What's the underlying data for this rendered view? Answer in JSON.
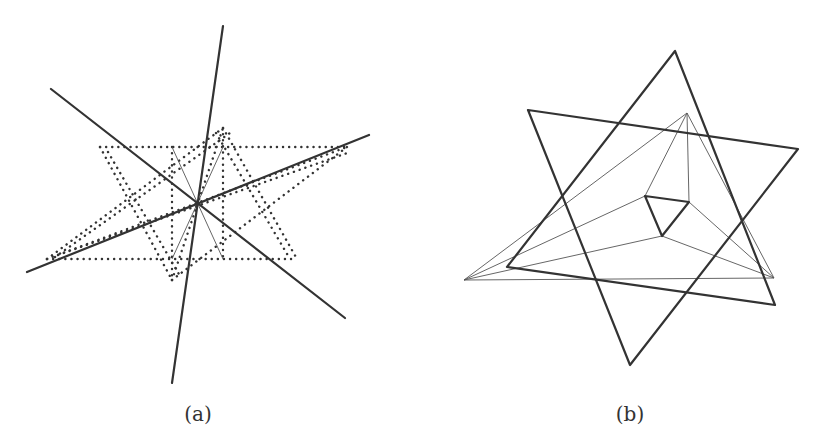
{
  "labels": {
    "a": "(a)",
    "b": "(b)"
  },
  "colors": {
    "stroke": "#333333",
    "thin_stroke": "#555555",
    "background": "#ffffff"
  },
  "diagram_a": {
    "center": [
      197,
      203
    ],
    "thick_lines": [
      [
        [
          223,
          26
        ],
        [
          172,
          383
        ]
      ],
      [
        [
          51,
          89
        ],
        [
          345,
          318
        ]
      ],
      [
        [
          27,
          272
        ],
        [
          369,
          135
        ]
      ]
    ],
    "thin_lines": [
      [
        [
          172,
          147
        ],
        [
          223,
          259
        ]
      ],
      [
        [
          223,
          147
        ],
        [
          172,
          259
        ]
      ]
    ],
    "dotted_lines": [
      [
        [
          100,
          147
        ],
        [
          347,
          147
        ]
      ],
      [
        [
          47,
          259
        ],
        [
          297,
          259
        ]
      ],
      [
        [
          172,
          147
        ],
        [
          172,
          280
        ]
      ],
      [
        [
          223,
          128
        ],
        [
          223,
          259
        ]
      ],
      [
        [
          100,
          147
        ],
        [
          172,
          280
        ]
      ],
      [
        [
          108,
          152
        ],
        [
          180,
          276
        ]
      ],
      [
        [
          223,
          128
        ],
        [
          297,
          259
        ]
      ],
      [
        [
          216,
          133
        ],
        [
          290,
          259
        ]
      ],
      [
        [
          47,
          259
        ],
        [
          223,
          128
        ]
      ],
      [
        [
          55,
          257
        ],
        [
          230,
          133
        ]
      ],
      [
        [
          47,
          259
        ],
        [
          347,
          147
        ]
      ],
      [
        [
          58,
          255
        ],
        [
          350,
          152
        ]
      ],
      [
        [
          172,
          280
        ],
        [
          347,
          147
        ]
      ],
      [
        [
          172,
          280
        ],
        [
          223,
          128
        ]
      ]
    ]
  },
  "diagram_b": {
    "thick_triangles": [
      [
        [
          675,
          51
        ],
        [
          507,
          267
        ],
        [
          775,
          305
        ]
      ],
      [
        [
          528,
          110
        ],
        [
          798,
          149
        ],
        [
          630,
          365
        ]
      ]
    ],
    "inner_triangle": [
      [
        645,
        196
      ],
      [
        689,
        202
      ],
      [
        662,
        236
      ]
    ],
    "thin_lines": [
      [
        [
          464,
          280
        ],
        [
          774,
          278
        ]
      ],
      [
        [
          464,
          280
        ],
        [
          687,
          113
        ]
      ],
      [
        [
          687,
          113
        ],
        [
          774,
          278
        ]
      ],
      [
        [
          687,
          113
        ],
        [
          645,
          196
        ]
      ],
      [
        [
          687,
          113
        ],
        [
          689,
          202
        ]
      ],
      [
        [
          645,
          196
        ],
        [
          464,
          280
        ]
      ],
      [
        [
          662,
          236
        ],
        [
          464,
          280
        ]
      ],
      [
        [
          662,
          236
        ],
        [
          774,
          278
        ]
      ],
      [
        [
          689,
          202
        ],
        [
          774,
          278
        ]
      ]
    ]
  }
}
